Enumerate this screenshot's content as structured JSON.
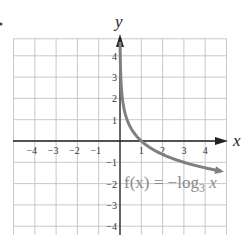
{
  "chart_data": {
    "type": "line",
    "title": "",
    "xlabel": "x",
    "ylabel": "y",
    "xlim": [
      -5,
      5
    ],
    "ylim": [
      -5,
      5
    ],
    "grid": true,
    "x_ticks": [
      "-4",
      "-3",
      "-2",
      "-1",
      "1",
      "2",
      "3",
      "4"
    ],
    "y_ticks": [
      "4",
      "3",
      "2",
      "1",
      "-1",
      "-2",
      "-3",
      "-4"
    ],
    "series": [
      {
        "name": "f(x) = -log_3 x",
        "label_parts": {
          "prefix": "f(x) = −log",
          "subscript": "3",
          "suffix": " x"
        },
        "color": "#808080",
        "x": [
          0.0123,
          0.037,
          0.111,
          0.333,
          1,
          3,
          9
        ],
        "y": [
          4,
          3,
          2,
          1,
          0,
          -1,
          -2
        ]
      }
    ],
    "annotations": [
      "f(x) = −log₃ x"
    ]
  },
  "labels": {
    "x_axis": "x",
    "y_axis": "y",
    "x_ticks": [
      "−4",
      "−3",
      "−2",
      "−1",
      "1",
      "2",
      "3",
      "4"
    ],
    "y_ticks_pos": [
      "4",
      "3",
      "2",
      "1"
    ],
    "y_ticks_neg": [
      "−1",
      "−2",
      "−3",
      "−4"
    ],
    "fn_prefix": "f(x) = −log",
    "fn_sub": "3",
    "fn_suffix": " x"
  },
  "colors": {
    "grid": "#c8c8c8",
    "axis": "#222222",
    "curve": "#808080"
  }
}
